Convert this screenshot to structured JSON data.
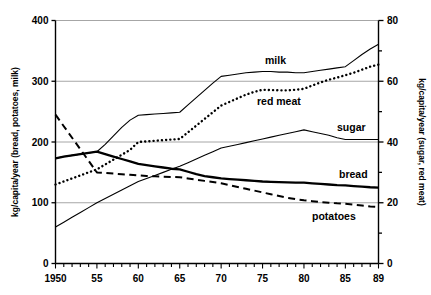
{
  "chart_data": {
    "type": "line",
    "title": "",
    "xlabel": "",
    "ylabel": "kg/capita/year (bread, potatoes, milk)",
    "ylabel_right": "kg/capita/year (sugar, red meat)",
    "grid": true,
    "legend_position": "inline-annotations",
    "x": [
      1950,
      1951,
      1952,
      1953,
      1954,
      1955,
      1956,
      1957,
      1958,
      1959,
      1960,
      1961,
      1962,
      1963,
      1964,
      1965,
      1966,
      1967,
      1968,
      1969,
      1970,
      1971,
      1972,
      1973,
      1974,
      1975,
      1976,
      1977,
      1978,
      1979,
      1980,
      1981,
      1982,
      1983,
      1984,
      1985,
      1986,
      1987,
      1988,
      1989
    ],
    "x_tick_labels": [
      "1950",
      "55",
      "60",
      "65",
      "70",
      "75",
      "80",
      "85",
      "89"
    ],
    "x_tick_values": [
      1950,
      1955,
      1960,
      1965,
      1970,
      1975,
      1980,
      1985,
      1989
    ],
    "xlim": [
      1950,
      1989
    ],
    "ylim": [
      0,
      400
    ],
    "y_ticks": [
      0,
      100,
      200,
      300,
      400
    ],
    "ylim_right": [
      0,
      80
    ],
    "y_ticks_right": [
      0,
      20,
      40,
      60,
      80
    ],
    "series": [
      {
        "name": "milk",
        "axis": "left",
        "style": "thin-solid",
        "label": "milk",
        "values": [
          173,
          176,
          178,
          180,
          182,
          184,
          196,
          210,
          224,
          236,
          244,
          245,
          246,
          247,
          248,
          249,
          261,
          273,
          285,
          297,
          308,
          310,
          312,
          314,
          315,
          316,
          316,
          315,
          315,
          314,
          314,
          316,
          318,
          320,
          322,
          324,
          334,
          344,
          353,
          361
        ]
      },
      {
        "name": "red meat",
        "axis": "right",
        "style": "dotted",
        "label": "red meat",
        "values": [
          26,
          27,
          28,
          29,
          30,
          31,
          32.6,
          34.2,
          35.8,
          37.4,
          40,
          40.2,
          40.4,
          40.6,
          40.8,
          41,
          43.2,
          45.4,
          47.6,
          49.8,
          52,
          53.2,
          54.4,
          55.6,
          56.5,
          57.2,
          57.1,
          57,
          57,
          57.2,
          57.5,
          58.6,
          59.6,
          60.5,
          61.2,
          62,
          62.8,
          63.8,
          64.8,
          65.5
        ]
      },
      {
        "name": "sugar",
        "axis": "right",
        "style": "thin-solid",
        "label": "sugar",
        "values": [
          12,
          13.6,
          15.2,
          16.8,
          18.4,
          20,
          21.4,
          22.8,
          24.2,
          25.6,
          27,
          28,
          29,
          30,
          31,
          32,
          33.2,
          34.4,
          35.6,
          36.8,
          38,
          38.6,
          39.2,
          39.8,
          40.4,
          41,
          41.6,
          42.2,
          42.8,
          43.4,
          44,
          43.4,
          42.8,
          42.2,
          41.4,
          40.8,
          40.8,
          40.8,
          40.8,
          40.8
        ]
      },
      {
        "name": "bread",
        "axis": "left",
        "style": "thick-solid",
        "label": "bread",
        "values": [
          173,
          176,
          178,
          180,
          182,
          184,
          180,
          176,
          172,
          168,
          164,
          162,
          160,
          158,
          156,
          155,
          151,
          147,
          144,
          142,
          140,
          139,
          138,
          137,
          136,
          135,
          134.5,
          134,
          133.5,
          133,
          133,
          132,
          131,
          130,
          129,
          128.5,
          127.5,
          126.5,
          125.5,
          125
        ]
      },
      {
        "name": "potatoes",
        "axis": "left",
        "style": "dashed",
        "label": "potatoes",
        "values": [
          245,
          226,
          207,
          188,
          169,
          150,
          149,
          148,
          147,
          146,
          145,
          144,
          143.5,
          143,
          142.5,
          142,
          140,
          138,
          136,
          134,
          132,
          129,
          126,
          123,
          120,
          117,
          114,
          111,
          108,
          106,
          104,
          102.5,
          101,
          100,
          99,
          98.5,
          97,
          95.5,
          94,
          93
        ]
      }
    ]
  },
  "labels": {
    "milk": "milk",
    "red_meat": "red meat",
    "sugar": "sugar",
    "bread": "bread",
    "potatoes": "potatoes",
    "y_left_title": "kg/capita/year (bread, potatoes, milk)",
    "y_right_title": "kg/capita/year (sugar, red meat)"
  },
  "y_left_ticks": [
    "0",
    "100",
    "200",
    "300",
    "400"
  ],
  "y_right_ticks": [
    "0",
    "20",
    "40",
    "60",
    "80"
  ],
  "x_ticks": [
    "1950",
    "55",
    "60",
    "65",
    "70",
    "75",
    "80",
    "85",
    "89"
  ],
  "colors": {
    "axis": "#000000",
    "grid": "#a6a6a6",
    "series": "#000000",
    "background": "#ffffff"
  }
}
